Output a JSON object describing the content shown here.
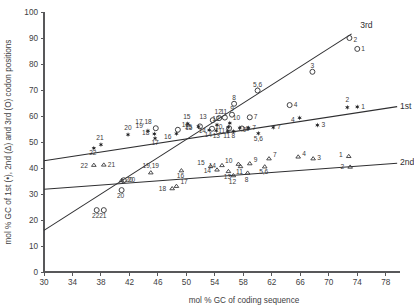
{
  "chart_data": {
    "type": "scatter",
    "title": "",
    "xlabel": "mol % GC of coding sequence",
    "ylabel": "mol % GC of 1st (•), 2nd (Δ) and 3rd (O) codon positions",
    "xlim": [
      30,
      80
    ],
    "ylim": [
      0,
      100
    ],
    "xticks": [
      30,
      34,
      38,
      42,
      46,
      50,
      54,
      58,
      62,
      66,
      70,
      74,
      78
    ],
    "yticks": [
      0,
      10,
      20,
      30,
      40,
      50,
      60,
      70,
      80,
      90,
      100
    ],
    "grid": false,
    "legend_position": "inline-axis-label",
    "series": [
      {
        "name": "1st codon position",
        "marker": "filled-star",
        "points": [
          {
            "label": "22",
            "x": 37.0,
            "y": 47.6,
            "lx": -1,
            "ly": 7
          },
          {
            "label": "21",
            "x": 38.0,
            "y": 49.0,
            "lx": -1,
            "ly": -5
          },
          {
            "label": "20",
            "x": 41.8,
            "y": 52.8,
            "lx": 0,
            "ly": -5
          },
          {
            "label": "19",
            "x": 44.6,
            "y": 54.3,
            "lx": -5,
            "ly": -3
          },
          {
            "label": "18",
            "x": 45.5,
            "y": 53.1,
            "lx": -5,
            "ly": 1
          },
          {
            "label": "17",
            "x": 45.6,
            "y": 51.4,
            "lx": 0,
            "ly": 7
          },
          {
            "label": "16",
            "x": 48.6,
            "y": 53.2,
            "lx": -5,
            "ly": 5
          },
          {
            "label": "15",
            "x": 50.2,
            "y": 57.0,
            "lx": -1,
            "ly": -5
          },
          {
            "label": "15",
            "x": 51.7,
            "y": 55.9,
            "lx": -6,
            "ly": 3
          },
          {
            "label": "14",
            "x": 53.2,
            "y": 54.6,
            "lx": -1,
            "ly": 7
          },
          {
            "label": "13",
            "x": 54.2,
            "y": 54.4,
            "lx": 0,
            "ly": 7
          },
          {
            "label": "12",
            "x": 54.3,
            "y": 56.6,
            "lx": -1,
            "ly": -4
          },
          {
            "label": "11",
            "x": 55.8,
            "y": 54.3,
            "lx": -1,
            "ly": 7
          },
          {
            "label": "10",
            "x": 56.1,
            "y": 57.3,
            "lx": 3,
            "ly": -3
          },
          {
            "label": "10",
            "x": 55.9,
            "y": 55.7,
            "lx": -6,
            "ly": 2
          },
          {
            "label": "8",
            "x": 56.6,
            "y": 54.1,
            "lx": 0,
            "ly": 7
          },
          {
            "label": "9",
            "x": 57.5,
            "y": 55.4,
            "lx": 3,
            "ly": 4
          },
          {
            "label": "7",
            "x": 58.7,
            "y": 55.4,
            "lx": 4,
            "ly": 2
          },
          {
            "label": "5,6",
            "x": 60.1,
            "y": 53.3,
            "lx": 0,
            "ly": 8
          },
          {
            "label": "7",
            "x": 62.2,
            "y": 55.6,
            "lx": 4,
            "ly": 2
          },
          {
            "label": "4",
            "x": 65.9,
            "y": 59.3,
            "lx": -5,
            "ly": 4
          },
          {
            "label": "3",
            "x": 68.4,
            "y": 56.5,
            "lx": 4,
            "ly": 2
          },
          {
            "label": "2",
            "x": 72.6,
            "y": 63.3,
            "lx": 0,
            "ly": -5
          },
          {
            "label": "1",
            "x": 74.0,
            "y": 63.5,
            "lx": 4,
            "ly": 2
          }
        ]
      },
      {
        "name": "2nd codon position",
        "marker": "open-triangle",
        "points": [
          {
            "label": "22",
            "x": 37.0,
            "y": 41.2,
            "lx": -6,
            "ly": 3
          },
          {
            "label": "21",
            "x": 38.4,
            "y": 41.3,
            "lx": 4,
            "ly": 2
          },
          {
            "label": "20",
            "x": 40.9,
            "y": 35.3,
            "lx": 4,
            "ly": 2
          },
          {
            "label": "19,19",
            "x": 45.0,
            "y": 38.3,
            "lx": 0,
            "ly": -4
          },
          {
            "label": "18",
            "x": 48.0,
            "y": 32.2,
            "lx": -6,
            "ly": 3
          },
          {
            "label": "17",
            "x": 48.6,
            "y": 33.1,
            "lx": 4,
            "ly": -2
          },
          {
            "label": "16",
            "x": 49.3,
            "y": 39.1,
            "lx": -1,
            "ly": 8
          },
          {
            "label": "15",
            "x": 53.4,
            "y": 40.7,
            "lx": -6,
            "ly": -1
          },
          {
            "label": "14",
            "x": 54.3,
            "y": 39.4,
            "lx": -6,
            "ly": 3
          },
          {
            "label": "14",
            "x": 55.0,
            "y": 41.1,
            "lx": -6,
            "ly": 3
          },
          {
            "label": "13",
            "x": 55.9,
            "y": 38.8,
            "lx": -1,
            "ly": 8
          },
          {
            "label": "12",
            "x": 56.6,
            "y": 37.2,
            "lx": -1,
            "ly": 9
          },
          {
            "label": "10",
            "x": 57.3,
            "y": 41.6,
            "lx": -6,
            "ly": -1
          },
          {
            "label": "11",
            "x": 57.6,
            "y": 40.7,
            "lx": -1,
            "ly": 8
          },
          {
            "label": "8",
            "x": 58.6,
            "y": 38.2,
            "lx": -1,
            "ly": 9
          },
          {
            "label": "9",
            "x": 58.9,
            "y": 41.8,
            "lx": 4,
            "ly": -1
          },
          {
            "label": "5,6",
            "x": 61.0,
            "y": 40.6,
            "lx": -1,
            "ly": 8
          },
          {
            "label": "7",
            "x": 61.6,
            "y": 43.7,
            "lx": 4,
            "ly": -1
          },
          {
            "label": "4",
            "x": 65.7,
            "y": 44.4,
            "lx": 4,
            "ly": -1
          },
          {
            "label": "3",
            "x": 67.8,
            "y": 43.7,
            "lx": 4,
            "ly": 2
          },
          {
            "label": "1",
            "x": 72.8,
            "y": 44.6,
            "lx": -6,
            "ly": 1
          },
          {
            "label": "2",
            "x": 73.0,
            "y": 40.5,
            "lx": -6,
            "ly": 2
          }
        ]
      },
      {
        "name": "3rd codon position",
        "marker": "open-circle",
        "points": [
          {
            "label": "22",
            "x": 37.4,
            "y": 23.8,
            "lx": -1,
            "ly": 8
          },
          {
            "label": "21",
            "x": 38.4,
            "y": 23.8,
            "lx": -1,
            "ly": 8
          },
          {
            "label": "20",
            "x": 40.9,
            "y": 31.5,
            "lx": -1,
            "ly": 8
          },
          {
            "label": "20",
            "x": 41.2,
            "y": 35.3,
            "lx": 4,
            "ly": 2
          },
          {
            "label": "17,18",
            "x": 45.7,
            "y": 55.3,
            "lx": -4,
            "ly": -4
          },
          {
            "label": "16",
            "x": 48.8,
            "y": 54.7,
            "lx": 4,
            "ly": -3
          },
          {
            "label": "15",
            "x": 51.9,
            "y": 56.0,
            "lx": -8,
            "ly": 3
          },
          {
            "label": "13",
            "x": 53.7,
            "y": 58.4,
            "lx": -6,
            "ly": -1
          },
          {
            "label": "12",
            "x": 54.6,
            "y": 59.2,
            "lx": -1,
            "ly": -4
          },
          {
            "label": "11",
            "x": 55.4,
            "y": 59.4,
            "lx": -1,
            "ly": -4
          },
          {
            "label": "14",
            "x": 53.6,
            "y": 55.1,
            "lx": -6,
            "ly": 4
          },
          {
            "label": "9",
            "x": 56.4,
            "y": 60.5,
            "lx": 0,
            "ly": -4
          },
          {
            "label": "11",
            "x": 56.0,
            "y": 55.3,
            "lx": -4,
            "ly": 5
          },
          {
            "label": "9",
            "x": 57.8,
            "y": 55.2,
            "lx": 4,
            "ly": 3
          },
          {
            "label": "8",
            "x": 56.7,
            "y": 64.7,
            "lx": 0,
            "ly": -4
          },
          {
            "label": "7",
            "x": 58.9,
            "y": 59.5,
            "lx": 4,
            "ly": 2
          },
          {
            "label": "5,6",
            "x": 60.0,
            "y": 69.8,
            "lx": 0,
            "ly": -4
          },
          {
            "label": "4",
            "x": 64.5,
            "y": 64.2,
            "lx": 4,
            "ly": 2
          },
          {
            "label": "3",
            "x": 67.7,
            "y": 77.0,
            "lx": 0,
            "ly": -4
          },
          {
            "label": "2",
            "x": 72.9,
            "y": 90.0,
            "lx": 4,
            "ly": 4
          },
          {
            "label": "1",
            "x": 74.0,
            "y": 85.8,
            "lx": 4,
            "ly": 2
          }
        ]
      }
    ],
    "trendlines": [
      {
        "label": "3rd",
        "x0": 30.0,
        "y0": 16.0,
        "x1": 73.2,
        "y1": 91.6,
        "label_x": 74.4,
        "label_y": 95.0
      },
      {
        "label": "1st",
        "x0": 30.0,
        "y0": 42.8,
        "x1": 79.6,
        "y1": 63.6,
        "label_x": 80.0,
        "label_y": 63.9
      },
      {
        "label": "2nd",
        "x0": 30.0,
        "y0": 31.8,
        "x1": 79.6,
        "y1": 41.8,
        "label_x": 80.0,
        "label_y": 42.4
      }
    ]
  }
}
